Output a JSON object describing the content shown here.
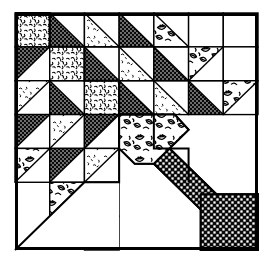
{
  "figure": {
    "block_name": "Basket / Cake Stand Quilt Block",
    "style": "black and white line-art patchwork diagram",
    "canvas": {
      "width": 270,
      "height": 264
    },
    "frame": {
      "x": 15,
      "y": 13,
      "width": 243,
      "height": 237,
      "stroke": "#000000",
      "stroke_width": 3
    },
    "grid": {
      "rows": 7,
      "cols": 7,
      "cell_size": 34.7,
      "line_stroke": "#000000",
      "line_width": 1.4
    }
  },
  "palette": {
    "ink": "#000000",
    "paper": "#ffffff",
    "solid_dark": "#111111",
    "fill_plain": "#ffffff"
  },
  "fabrics": [
    {
      "id": "plain",
      "name": "plain-white",
      "label": "Background (white)"
    },
    {
      "id": "dark",
      "name": "dark-dotted",
      "label": "Dark dotted print"
    },
    {
      "id": "squiggle",
      "name": "squiggle-print",
      "label": "Light squiggle print"
    },
    {
      "id": "light",
      "name": "light-sparse-print",
      "label": "Light sparse print"
    },
    {
      "id": "leaf",
      "name": "leaf-floral-print",
      "label": "Leaf / floral print"
    },
    {
      "id": "check",
      "name": "checkered-weave",
      "label": "Checkered weave print"
    }
  ],
  "units": [
    {
      "r": 0,
      "c": 0,
      "shape": "square",
      "fabric": "squiggle",
      "name": "unit-r1c1"
    },
    {
      "r": 0,
      "c": 1,
      "shape": "tri-bl",
      "fabric": "dark",
      "name": "unit-r1c2"
    },
    {
      "r": 0,
      "c": 2,
      "shape": "tri-bl",
      "fabric": "light",
      "name": "unit-r1c3"
    },
    {
      "r": 0,
      "c": 3,
      "shape": "tri-bl",
      "fabric": "dark",
      "name": "unit-r1c4"
    },
    {
      "r": 0,
      "c": 4,
      "shape": "tri-bl",
      "fabric": "leaf",
      "name": "unit-r1c5"
    },
    {
      "r": 0,
      "c": 5,
      "shape": "square",
      "fabric": "plain",
      "name": "unit-r1c6"
    },
    {
      "r": 0,
      "c": 6,
      "shape": "square",
      "fabric": "plain",
      "name": "unit-r1c7"
    },
    {
      "r": 1,
      "c": 0,
      "shape": "tri-tl",
      "fabric": "dark",
      "name": "unit-r2c1"
    },
    {
      "r": 1,
      "c": 1,
      "shape": "square",
      "fabric": "squiggle",
      "name": "unit-r2c2"
    },
    {
      "r": 1,
      "c": 2,
      "shape": "tri-bl",
      "fabric": "dark",
      "name": "unit-r2c3"
    },
    {
      "r": 1,
      "c": 3,
      "shape": "tri-bl",
      "fabric": "light",
      "name": "unit-r2c4"
    },
    {
      "r": 1,
      "c": 4,
      "shape": "tri-bl",
      "fabric": "dark",
      "name": "unit-r2c5"
    },
    {
      "r": 1,
      "c": 5,
      "shape": "tri-tl",
      "fabric": "leaf",
      "name": "unit-r2c6"
    },
    {
      "r": 1,
      "c": 6,
      "shape": "square",
      "fabric": "plain",
      "name": "unit-r2c7"
    },
    {
      "r": 2,
      "c": 0,
      "shape": "tri-tl",
      "fabric": "light",
      "name": "unit-r3c1"
    },
    {
      "r": 2,
      "c": 1,
      "shape": "tri-bl",
      "fabric": "dark",
      "name": "unit-r3c2"
    },
    {
      "r": 2,
      "c": 2,
      "shape": "square",
      "fabric": "squiggle",
      "name": "unit-r3c3"
    },
    {
      "r": 2,
      "c": 3,
      "shape": "tri-bl",
      "fabric": "dark",
      "name": "unit-r3c4"
    },
    {
      "r": 2,
      "c": 4,
      "shape": "tri-bl",
      "fabric": "light",
      "name": "unit-r3c5"
    },
    {
      "r": 2,
      "c": 5,
      "shape": "tri-bl",
      "fabric": "dark",
      "name": "unit-r3c6"
    },
    {
      "r": 2,
      "c": 6,
      "shape": "tri-tl",
      "fabric": "leaf",
      "name": "unit-r3c7"
    },
    {
      "r": 3,
      "c": 0,
      "shape": "tri-tl",
      "fabric": "dark",
      "name": "unit-r4c1"
    },
    {
      "r": 3,
      "c": 1,
      "shape": "tri-tl",
      "fabric": "light",
      "name": "unit-r4c2"
    },
    {
      "r": 3,
      "c": 2,
      "shape": "tri-tl",
      "fabric": "dark",
      "name": "unit-r4c3"
    },
    {
      "r": 4,
      "c": 0,
      "shape": "tri-tl",
      "fabric": "leaf",
      "name": "unit-r5c1"
    },
    {
      "r": 4,
      "c": 1,
      "shape": "tri-tl",
      "fabric": "dark",
      "name": "unit-r5c2"
    },
    {
      "r": 4,
      "c": 2,
      "shape": "tri-tl",
      "fabric": "light",
      "name": "unit-r5c3"
    },
    {
      "r": 5,
      "c": 1,
      "shape": "tri-tl",
      "fabric": "leaf",
      "name": "unit-r6c2"
    },
    {
      "r": 5,
      "c": 2,
      "shape": "tri-tl",
      "fabric": "dark",
      "name": "unit-r6c3"
    },
    {
      "r": 6,
      "c": 2,
      "shape": "tri-tl",
      "fabric": "leaf",
      "name": "unit-r7c3"
    }
  ],
  "motifs": {
    "leaf_diamond": {
      "name": "leaf-diamond-basket-top",
      "fabric": "leaf",
      "points": "3.0,3.0 4.6,3.0 5.0,3.45 4.0,4.45 3.45,4.45 3.0,4.0",
      "description": "Large leaf-print diamond forming the top of the basket"
    },
    "handle_band": {
      "name": "checkered-handle-band",
      "fabric": "check",
      "points": "3.55,4.0 4.0,3.55 6.0,5.55 6.0,6.0 5.55,6.0",
      "description": "Checkered diagonal band sweeping from the basket to the lower-right corner"
    },
    "corner_square": {
      "name": "checkered-corner-square",
      "fabric": "check",
      "points": "5.35,5.35 7.0,5.35 7.0,7.0 5.35,7.0",
      "description": "Checkered square in the bottom-right corner"
    },
    "basket_outline": {
      "name": "basket-body-outline",
      "points": "3.0,3.0 3.0,5.0 2.0,5.0 0.0,7.0 3.0,7.0",
      "description": "Stepped outline of the white basket body area"
    }
  },
  "stairs": {
    "name": "diagonal-staircase-edge",
    "description": "Stair-stepped diagonal boundary of the triangle field running from upper-right to lower-left"
  },
  "legend": {
    "visible": false,
    "note": "No text labels appear in the image"
  }
}
